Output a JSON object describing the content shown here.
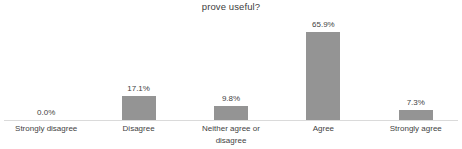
{
  "chart_data": {
    "type": "bar",
    "title": "prove useful?",
    "xlabel": "",
    "ylabel": "",
    "categories": [
      "Strongly disagree",
      "Disagree",
      "Neither agree or disagree",
      "Agree",
      "Strongly agree"
    ],
    "values": [
      0.0,
      17.1,
      9.8,
      65.9,
      7.3
    ],
    "value_labels": [
      "0.0%",
      "17.1%",
      "9.8%",
      "65.9%",
      "7.3%"
    ],
    "ylim": [
      0,
      70
    ],
    "grid": false,
    "legend": false,
    "bar_color": "#949494",
    "text_color": "#3f3f3f",
    "axis_line_color": "#dadada",
    "background_color": "#ffffff"
  }
}
